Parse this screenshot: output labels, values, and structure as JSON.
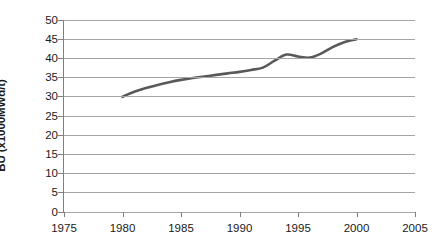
{
  "chart_data": {
    "type": "line",
    "title": "",
    "xlabel": "",
    "ylabel": "BU (x1000MWd/t)",
    "xlim": [
      1975,
      2005
    ],
    "ylim": [
      0,
      50
    ],
    "grid": true,
    "legend": "none",
    "xticks": [
      1975,
      1980,
      1985,
      1990,
      1995,
      2000,
      2005
    ],
    "yticks": [
      0,
      5,
      10,
      15,
      20,
      25,
      30,
      35,
      40,
      45,
      50
    ],
    "series": [
      {
        "name": "Burnup",
        "color": "#595959",
        "x": [
          1980,
          1981,
          1982,
          1983,
          1984,
          1985,
          1986,
          1987,
          1988,
          1989,
          1990,
          1991,
          1992,
          1993,
          1994,
          1995,
          1996,
          1997,
          1998,
          1999,
          2000
        ],
        "values": [
          30.0,
          31.3,
          32.3,
          33.1,
          33.8,
          34.4,
          34.9,
          35.3,
          35.7,
          36.1,
          36.5,
          37.0,
          37.6,
          39.4,
          41.0,
          40.5,
          40.2,
          41.3,
          43.0,
          44.3,
          45.0
        ]
      }
    ]
  },
  "axes": {
    "y_title": "BU (x1000MWd/t)",
    "y_tick_labels": [
      "50",
      "45",
      "40",
      "35",
      "30",
      "25",
      "20",
      "15",
      "10",
      "5",
      "0"
    ],
    "x_tick_labels": [
      "1975",
      "1980",
      "1985",
      "1990",
      "1995",
      "2000",
      "2005"
    ]
  },
  "colors": {
    "series_line": "#595959",
    "gridline": "#a6a6a6",
    "axis": "#808080",
    "text": "#1a1a1a",
    "background": "#ffffff"
  }
}
